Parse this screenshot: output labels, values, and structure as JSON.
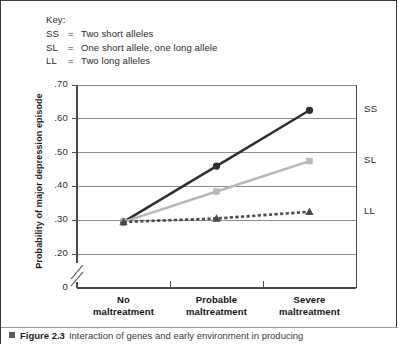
{
  "key": {
    "title": "Key:",
    "entries": [
      {
        "code": "SS",
        "eq": "=",
        "desc": "Two short alleles"
      },
      {
        "code": "SL",
        "eq": "=",
        "desc": "One short allele, one long allele"
      },
      {
        "code": "LL",
        "eq": "=",
        "desc": "Two long alleles"
      }
    ]
  },
  "caption": {
    "marker": "square-bullet",
    "figure_label": "Figure 2.3",
    "text": "Interaction of genes and early environment in producing"
  },
  "chart_data": {
    "type": "line",
    "title": "",
    "xlabel": "",
    "ylabel": "Probability of major depression episode",
    "categories": [
      "No maltreatment",
      "Probable maltreatment",
      "Severe maltreatment"
    ],
    "category_lines": [
      [
        "No",
        "maltreatment"
      ],
      [
        "Probable",
        "maltreatment"
      ],
      [
        "Severe",
        "maltreatment"
      ]
    ],
    "ylim": [
      0.2,
      0.7
    ],
    "y_ticks": [
      0.7,
      0.6,
      0.5,
      0.4,
      0.3,
      0.2
    ],
    "y_tick_labels": [
      ".70",
      ".60",
      ".50",
      ".40",
      ".30",
      ".20"
    ],
    "y_origin_label": "0",
    "axis_break": true,
    "grid": true,
    "grid_axis": "y",
    "legend_position": "right-of-series-end",
    "series": [
      {
        "name": "SS",
        "label": "SS",
        "values": [
          0.295,
          0.46,
          0.625
        ],
        "color": "#2e2e2e",
        "line_style": "solid",
        "marker": "circle"
      },
      {
        "name": "SL",
        "label": "SL",
        "values": [
          0.295,
          0.385,
          0.475
        ],
        "color": "#b7b7b7",
        "line_style": "solid",
        "marker": "square"
      },
      {
        "name": "LL",
        "label": "LL",
        "values": [
          0.295,
          0.305,
          0.325
        ],
        "color": "#4a4a4a",
        "line_style": "dashed",
        "marker": "triangle"
      }
    ]
  },
  "colors": {
    "frame": "#3a3a3a",
    "gridline": "#8d8d8d",
    "axis": "#4a4a4a",
    "text": "#2b2b2b"
  }
}
